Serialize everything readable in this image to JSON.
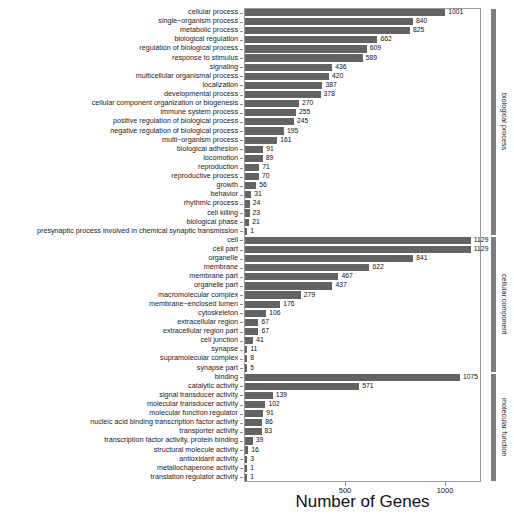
{
  "chart_data": {
    "type": "bar",
    "orientation": "horizontal",
    "title": "",
    "xlabel": "Number of Genes",
    "ylabel": "",
    "xlim": [
      0,
      1180
    ],
    "xticks": [
      500,
      1000
    ],
    "xtick_labels": [
      "500",
      "1000"
    ],
    "grid": false,
    "legend": "none",
    "bar_color": "#636363",
    "categories": [
      "cellular process",
      "single−organism process",
      "metabolic process",
      "biological regulation",
      "regulation of biological process",
      "response to stimulus",
      "signaling",
      "multicellular organismal process",
      "localization",
      "developmental process",
      "cellular component organization or biogenesis",
      "immune system process",
      "positive regulation of biological process",
      "negative regulation of biological process",
      "multi−organism process",
      "biological adhesion",
      "locomotion",
      "reproduction",
      "reproductive process",
      "growth",
      "behavior",
      "rhythmic process",
      "cell killing",
      "biological phase",
      "presynaptic process involved in chemical synaptic transmission",
      "cell",
      "cell part",
      "organelle",
      "membrane",
      "membrane part",
      "organelle part",
      "macromolecular complex",
      "membrane−enclosed lumen",
      "cytoskeleton",
      "extracellular region",
      "extracellular region part",
      "cell junction",
      "synapse",
      "supramolecular complex",
      "synapse part",
      "binding",
      "catalytic activity",
      "signal transducer activity",
      "molecular transducer activity",
      "molecular function regulator",
      "nucleic acid binding transcription factor activity",
      "transporter activity",
      "transcription factor activity, protein binding",
      "structural molecule activity",
      "antioxidant activity",
      "metallochaperone activity",
      "translation regulator activity"
    ],
    "values": [
      1001,
      840,
      825,
      662,
      609,
      589,
      436,
      420,
      387,
      378,
      270,
      255,
      245,
      195,
      161,
      91,
      89,
      71,
      70,
      56,
      31,
      24,
      23,
      21,
      1,
      1129,
      1129,
      841,
      622,
      467,
      437,
      279,
      176,
      106,
      67,
      67,
      41,
      11,
      8,
      5,
      1075,
      571,
      139,
      102,
      91,
      86,
      83,
      39,
      16,
      3,
      1,
      1
    ],
    "groups": [
      {
        "label": "biological process",
        "start_index": 0,
        "end_index": 24,
        "color": "#7d7d7d"
      },
      {
        "label": "cellular component",
        "start_index": 25,
        "end_index": 39,
        "color": "#7d7d7d"
      },
      {
        "label": "molecular function",
        "start_index": 40,
        "end_index": 51,
        "color": "#7d7d7d"
      }
    ]
  }
}
